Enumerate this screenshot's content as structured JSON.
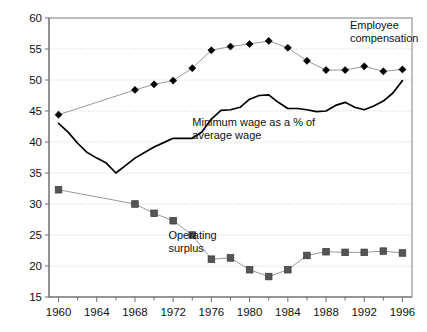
{
  "chart_data": {
    "type": "line",
    "title": "",
    "subtitle": "",
    "xlabel": "",
    "ylabel": "",
    "xlim": [
      1959,
      1997
    ],
    "ylim": [
      15,
      60
    ],
    "yticks": [
      15,
      20,
      25,
      30,
      35,
      40,
      45,
      50,
      55,
      60
    ],
    "xticks": [
      1960,
      1964,
      1968,
      1972,
      1976,
      1980,
      1984,
      1988,
      1992,
      1996
    ],
    "xticks_minor": [
      1962,
      1966,
      1970,
      1974,
      1978,
      1982,
      1986,
      1990,
      1994
    ],
    "grid": "horizontal-dotted",
    "legend": "inline-annotations",
    "annotations": [
      {
        "name": "employee-compensation-label",
        "text_line1": "Employee",
        "text_line2": "compensation",
        "x": 1990.5,
        "y": 58.2
      },
      {
        "name": "minimum-wage-label",
        "text_line1": "Minimum wage as a % of",
        "text_line2": "average wage",
        "x": 1974.0,
        "y": 42.6
      },
      {
        "name": "operating-surplus-label",
        "text_line1": "Operating",
        "text_line2": "surplus",
        "x": 1971.5,
        "y": 24.3
      }
    ],
    "series": [
      {
        "name": "Employee compensation",
        "marker": "diamond",
        "marker_color": "#000000",
        "line_color": "#8d8d8d",
        "x": [
          1960,
          1968,
          1970,
          1972,
          1974,
          1976,
          1978,
          1980,
          1982,
          1984,
          1986,
          1988,
          1990,
          1992,
          1994,
          1996
        ],
        "values": [
          44.4,
          48.4,
          49.3,
          49.9,
          51.9,
          54.8,
          55.4,
          55.8,
          56.3,
          55.2,
          53.1,
          51.6,
          51.6,
          52.2,
          51.4,
          51.7
        ]
      },
      {
        "name": "Operating surplus",
        "marker": "square",
        "marker_color": "#555555",
        "line_color": "#8d8d8d",
        "x": [
          1960,
          1968,
          1970,
          1972,
          1974,
          1976,
          1978,
          1980,
          1982,
          1984,
          1986,
          1988,
          1990,
          1992,
          1994,
          1996
        ],
        "values": [
          32.3,
          30.0,
          28.5,
          27.3,
          25.0,
          21.1,
          21.3,
          19.4,
          18.3,
          19.4,
          21.7,
          22.3,
          22.2,
          22.2,
          22.4,
          22.1
        ]
      },
      {
        "name": "Minimum wage as a % of average wage",
        "marker": "none",
        "line_color": "#000000",
        "x": [
          1960,
          1961,
          1962,
          1963,
          1964,
          1965,
          1966,
          1967,
          1968,
          1969,
          1970,
          1971,
          1972,
          1973,
          1974,
          1975,
          1976,
          1977,
          1978,
          1979,
          1980,
          1981,
          1982,
          1983,
          1984,
          1985,
          1986,
          1987,
          1988,
          1989,
          1990,
          1991,
          1992,
          1993,
          1994,
          1995,
          1996
        ],
        "values": [
          43.0,
          41.6,
          39.8,
          38.3,
          37.4,
          36.6,
          35.0,
          36.2,
          37.4,
          38.3,
          39.2,
          39.9,
          40.6,
          40.6,
          40.6,
          41.6,
          43.7,
          45.1,
          45.2,
          45.6,
          46.9,
          47.5,
          47.6,
          46.4,
          45.4,
          45.4,
          45.2,
          44.9,
          45.0,
          45.9,
          46.4,
          45.6,
          45.2,
          45.8,
          46.6,
          47.9,
          49.9
        ]
      }
    ]
  }
}
